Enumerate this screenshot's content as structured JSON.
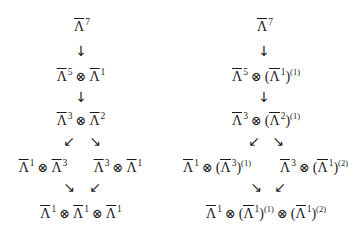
{
  "symbols": {
    "base": "Λ",
    "tensor": "⊗",
    "lparen": "(",
    "rparen": ")",
    "arrow_down": "↓",
    "arrow_sw": "↙",
    "arrow_se": "↘"
  },
  "left_diagram": {
    "nodes": [
      {
        "id": "L0",
        "text": "Λ̄^7",
        "factors": [
          {
            "exp": "7"
          }
        ]
      },
      {
        "id": "L1",
        "text": "Λ̄^5 ⊗ Λ̄^1",
        "factors": [
          {
            "exp": "5"
          },
          {
            "exp": "1"
          }
        ]
      },
      {
        "id": "L2",
        "text": "Λ̄^3 ⊗ Λ̄^2",
        "factors": [
          {
            "exp": "3"
          },
          {
            "exp": "2"
          }
        ]
      },
      {
        "id": "L3a",
        "text": "Λ̄^1 ⊗ Λ̄^3",
        "factors": [
          {
            "exp": "1"
          },
          {
            "exp": "3"
          }
        ]
      },
      {
        "id": "L3b",
        "text": "Λ̄^3 ⊗ Λ̄^1",
        "factors": [
          {
            "exp": "3"
          },
          {
            "exp": "1"
          }
        ]
      },
      {
        "id": "L4",
        "text": "Λ̄^1 ⊗ Λ̄^1 ⊗ Λ̄^1",
        "factors": [
          {
            "exp": "1"
          },
          {
            "exp": "1"
          },
          {
            "exp": "1"
          }
        ]
      }
    ]
  },
  "right_diagram": {
    "nodes": [
      {
        "id": "R0",
        "text": "Λ̄^7",
        "factors": [
          {
            "exp": "7"
          }
        ]
      },
      {
        "id": "R1",
        "text": "Λ̄^5 ⊗ (Λ̄^1)^(1)",
        "factors": [
          {
            "exp": "5"
          },
          {
            "exp": "1",
            "twist": "(1)"
          }
        ]
      },
      {
        "id": "R2",
        "text": "Λ̄^3 ⊗ (Λ̄^2)^(1)",
        "factors": [
          {
            "exp": "3"
          },
          {
            "exp": "2",
            "twist": "(1)"
          }
        ]
      },
      {
        "id": "R3a",
        "text": "Λ̄^1 ⊗ (Λ̄^3)^(1)",
        "factors": [
          {
            "exp": "1"
          },
          {
            "exp": "3",
            "twist": "(1)"
          }
        ]
      },
      {
        "id": "R3b",
        "text": "Λ̄^3 ⊗ (Λ̄^1)^(2)",
        "factors": [
          {
            "exp": "3"
          },
          {
            "exp": "1",
            "twist": "(2)"
          }
        ]
      },
      {
        "id": "R4",
        "text": "Λ̄^1 ⊗ (Λ̄^1)^(1) ⊗ (Λ̄^1)^(2)",
        "factors": [
          {
            "exp": "1"
          },
          {
            "exp": "1",
            "twist": "(1)"
          },
          {
            "exp": "1",
            "twist": "(2)"
          }
        ]
      }
    ]
  }
}
